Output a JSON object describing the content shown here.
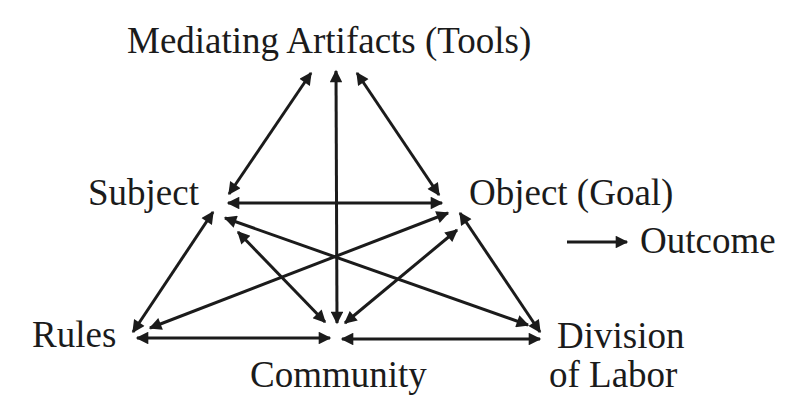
{
  "diagram": {
    "type": "activity-system-triangle",
    "nodes": {
      "tools": "Mediating Artifacts (Tools)",
      "subject": "Subject",
      "object": "Object (Goal)",
      "outcome": "Outcome",
      "rules": "Rules",
      "community": "Community",
      "division_line1": "Division",
      "division_line2": "of Labor"
    },
    "edges": [
      {
        "from": "tools",
        "to": "subject",
        "bidirectional": true
      },
      {
        "from": "tools",
        "to": "object",
        "bidirectional": true
      },
      {
        "from": "tools",
        "to": "community",
        "bidirectional": true
      },
      {
        "from": "subject",
        "to": "object",
        "bidirectional": true
      },
      {
        "from": "subject",
        "to": "rules",
        "bidirectional": true
      },
      {
        "from": "subject",
        "to": "community",
        "bidirectional": true
      },
      {
        "from": "subject",
        "to": "division_of_labor",
        "bidirectional": true
      },
      {
        "from": "object",
        "to": "rules",
        "bidirectional": true
      },
      {
        "from": "object",
        "to": "community",
        "bidirectional": true
      },
      {
        "from": "object",
        "to": "division_of_labor",
        "bidirectional": true
      },
      {
        "from": "rules",
        "to": "community",
        "bidirectional": true
      },
      {
        "from": "community",
        "to": "division_of_labor",
        "bidirectional": true
      },
      {
        "from": "object",
        "to": "outcome",
        "bidirectional": false
      }
    ],
    "colors": {
      "ink": "#1b1b1b",
      "background": "#ffffff"
    }
  }
}
